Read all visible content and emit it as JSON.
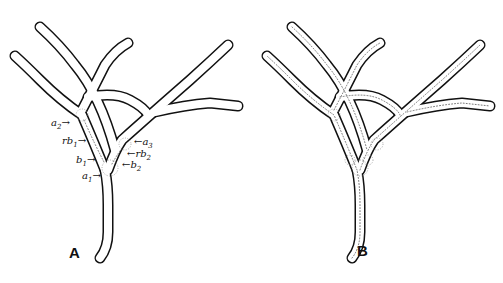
{
  "figure": {
    "panels": [
      {
        "id": "A",
        "label": "A"
      },
      {
        "id": "B",
        "label": "B"
      }
    ],
    "annotations": {
      "a2": {
        "base": "a",
        "sub": "2"
      },
      "rb1": {
        "base": "rb",
        "sub": "1"
      },
      "b1": {
        "base": "b",
        "sub": "1"
      },
      "a1": {
        "base": "a",
        "sub": "1"
      },
      "a3": {
        "base": "a",
        "sub": "3"
      },
      "rb2": {
        "base": "rb",
        "sub": "2"
      },
      "b2": {
        "base": "b",
        "sub": "2"
      }
    },
    "arrow_right": "→",
    "arrow_left": "←"
  }
}
